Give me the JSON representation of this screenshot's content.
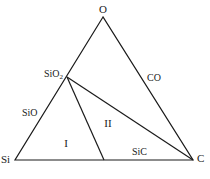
{
  "diagram": {
    "type": "ternary-phase-diagram",
    "vertices": {
      "top": "O",
      "left": "Si",
      "right": "C"
    },
    "edge_labels": {
      "left_edge": "SiO",
      "right_edge": "CO",
      "bottom_edge": "SiC"
    },
    "compound_label": {
      "base": "SiO",
      "subscript": "2"
    },
    "regions": {
      "region_1": "I",
      "region_2": "II"
    },
    "line_color": "#1a1a1a"
  }
}
